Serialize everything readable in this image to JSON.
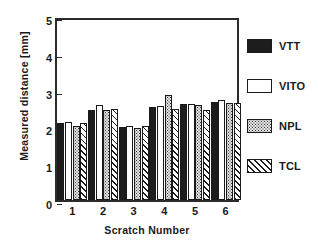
{
  "chart_data": {
    "type": "bar",
    "title": "",
    "xlabel": "Scratch Number",
    "ylabel": "Measured distance [mm]",
    "categories": [
      "1",
      "2",
      "3",
      "4",
      "5",
      "6"
    ],
    "ylim": [
      0,
      5
    ],
    "yticks": [
      "0",
      "1",
      "2",
      "3",
      "4",
      "5"
    ],
    "grid": false,
    "legend_position": "right",
    "series": [
      {
        "name": "VTT",
        "pattern": "solid-black",
        "color": "#1d1d1d",
        "values": [
          2.1,
          2.45,
          1.98,
          2.53,
          2.61,
          2.65
        ]
      },
      {
        "name": "VITO",
        "pattern": "open-white",
        "color": "#ffffff",
        "values": [
          2.12,
          2.57,
          2.0,
          2.55,
          2.62,
          2.72
        ]
      },
      {
        "name": "NPL",
        "pattern": "stippled-gray",
        "color": "#c9c9c9",
        "values": [
          2.02,
          2.45,
          1.96,
          2.85,
          2.58,
          2.63
        ]
      },
      {
        "name": "TCL",
        "pattern": "diagonal-hatch",
        "color": "#ffffff",
        "values": [
          2.08,
          2.47,
          2.01,
          2.48,
          2.45,
          2.63
        ]
      }
    ]
  }
}
